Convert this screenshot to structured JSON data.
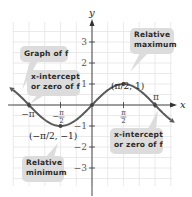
{
  "chart_data": {
    "type": "line",
    "title": "",
    "function": "f(x) = sin x",
    "xlabel": "x",
    "ylabel": "y",
    "xlim": [
      -3.93,
      3.93
    ],
    "ylim": [
      -3.8,
      3.8
    ],
    "grid": true,
    "x_ticks": [
      {
        "value": -3.1416,
        "label": "−π"
      },
      {
        "value": -1.5708,
        "label": "−π/2"
      },
      {
        "value": 1.5708,
        "label": "π/2"
      },
      {
        "value": 3.1416,
        "label": "π"
      }
    ],
    "y_ticks": [
      {
        "value": 3,
        "label": "3"
      },
      {
        "value": 2,
        "label": "2"
      },
      {
        "value": 1,
        "label": "1"
      },
      {
        "value": -1,
        "label": "−1"
      },
      {
        "value": -2,
        "label": "−2"
      },
      {
        "value": -3,
        "label": "−3"
      }
    ],
    "series": [
      {
        "name": "Graph of f",
        "x": [
          -3.93,
          -3.5343,
          -3.1416,
          -2.3562,
          -1.5708,
          -0.7854,
          0,
          0.7854,
          1.5708,
          2.3562,
          3.1416,
          3.5343,
          3.93
        ],
        "y": [
          0.707,
          0.383,
          0,
          -0.707,
          -1,
          -0.707,
          0,
          0.707,
          1,
          0.707,
          0,
          -0.383,
          -0.707
        ]
      }
    ],
    "key_points": [
      {
        "x": -3.1416,
        "y": 0,
        "label": "x-intercept or zero of f"
      },
      {
        "x": -1.5708,
        "y": -1,
        "label": "(−π/2, −1)",
        "kind": "Relative minimum"
      },
      {
        "x": 0,
        "y": 0,
        "label": "origin"
      },
      {
        "x": 1.5708,
        "y": 1,
        "label": "(π/2, 1)",
        "kind": "Relative maximum"
      },
      {
        "x": 3.1416,
        "y": 0,
        "label": "x-intercept or zero of f"
      }
    ],
    "annotations": [
      "Graph of f",
      "x-intercept or zero of f",
      "Relative maximum",
      "x-intercept or zero of f",
      "Relative minimum"
    ]
  },
  "axes": {
    "x_label": "x",
    "y_label": "y",
    "x_ticks": [
      "−π",
      "−π/2",
      "π/2",
      "π"
    ],
    "y_ticks": [
      "3",
      "2",
      "1",
      "−1",
      "−2",
      "−3"
    ]
  },
  "labels": {
    "max_point": "(π/2, 1)",
    "min_point": "(−π/2, −1)"
  },
  "callouts": {
    "graph_of_f": "Graph of f",
    "x_intercept_left": "x-intercept\nor zero of f",
    "relative_maximum": "Relative\nmaximum",
    "x_intercept_right": "x-intercept\nor zero of f",
    "relative_minimum": "Relative\nminimum"
  },
  "colors": {
    "curve": "#5a5a5a",
    "axis": "#333333",
    "grid": "#e4e4e4",
    "callout_bg": "#dcdcdc",
    "point": "#444444"
  }
}
